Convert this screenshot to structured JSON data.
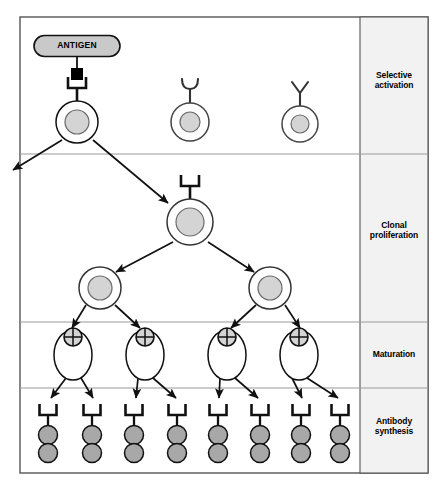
{
  "figure": {
    "frame": {
      "x": 20,
      "y": 17,
      "width": 408,
      "height": 456
    },
    "colors": {
      "outline": "#1a1a1a",
      "cell_fill": "#ffffff",
      "nucleus_fill": "#d4d4d4",
      "antibody_fill": "#a8a8a8",
      "antigen_fill": "#c9c9c9",
      "epitope_fill": "#000000",
      "panel_bg": "#f2f2f2",
      "divider": "#9a9a9a",
      "background": "#ffffff"
    }
  },
  "antigen": {
    "label": "ANTIGEN",
    "x": 77,
    "y": 46,
    "pill_width": 86,
    "pill_height": 21,
    "epitope": {
      "x": 77,
      "y": 74,
      "size": 11,
      "shape": "square"
    }
  },
  "stages": [
    {
      "id": "selective-activation",
      "label_line1": "Selective",
      "label_line2": "activation",
      "y_top": 17,
      "y_bottom": 154,
      "label_center_y": 82
    },
    {
      "id": "clonal-proliferation",
      "label_line1": "Clonal",
      "label_line2": "proliferation",
      "y_top": 154,
      "y_bottom": 322,
      "label_center_y": 232
    },
    {
      "id": "maturation",
      "label_line1": "Maturation",
      "label_line2": "",
      "y_top": 322,
      "y_bottom": 388,
      "label_center_y": 354
    },
    {
      "id": "antibody-synthesis",
      "label_line1": "Antibody",
      "label_line2": "synthesis",
      "y_top": 388,
      "y_bottom": 473,
      "label_center_y": 428
    }
  ],
  "panel": {
    "x": 360,
    "width": 68
  },
  "lymphocytes": [
    {
      "id": "lymphocyte-matching",
      "x": 77,
      "y": 122,
      "r_outer": 21,
      "r_inner": 12,
      "receptor": "bracket",
      "matched": true
    },
    {
      "id": "lymphocyte-u",
      "x": 190,
      "y": 122,
      "r_outer": 19,
      "r_inner": 10,
      "receptor": "u-shape",
      "matched": false
    },
    {
      "id": "lymphocyte-y",
      "x": 300,
      "y": 124,
      "r_outer": 18,
      "r_inner": 9,
      "receptor": "y-shape",
      "matched": false
    }
  ],
  "clonal_cells": [
    {
      "id": "clone-parent",
      "x": 190,
      "y": 222,
      "r_outer": 23,
      "r_inner": 14,
      "receptor": "bracket"
    },
    {
      "id": "clone-left",
      "x": 100,
      "y": 288,
      "r_outer": 21,
      "r_inner": 12,
      "receptor": "none"
    },
    {
      "id": "clone-right",
      "x": 270,
      "y": 288,
      "r_outer": 21,
      "r_inner": 12,
      "receptor": "none"
    }
  ],
  "plasma_cells": [
    {
      "id": "plasma-cell-1",
      "x": 73,
      "y": 355,
      "rx": 19,
      "ry": 25,
      "nucleus_x": 73,
      "nucleus_y": 337,
      "nucleus_r": 9
    },
    {
      "id": "plasma-cell-2",
      "x": 145,
      "y": 355,
      "rx": 19,
      "ry": 25,
      "nucleus_x": 145,
      "nucleus_y": 337,
      "nucleus_r": 9
    },
    {
      "id": "plasma-cell-3",
      "x": 227,
      "y": 355,
      "rx": 19,
      "ry": 25,
      "nucleus_x": 227,
      "nucleus_y": 337,
      "nucleus_r": 9
    },
    {
      "id": "plasma-cell-4",
      "x": 299,
      "y": 355,
      "rx": 19,
      "ry": 25,
      "nucleus_x": 299,
      "nucleus_y": 337,
      "nucleus_r": 9
    }
  ],
  "antibodies": [
    {
      "id": "antibody-1",
      "x": 48
    },
    {
      "id": "antibody-2",
      "x": 92
    },
    {
      "id": "antibody-3",
      "x": 134
    },
    {
      "id": "antibody-4",
      "x": 177
    },
    {
      "id": "antibody-5",
      "x": 218
    },
    {
      "id": "antibody-6",
      "x": 260
    },
    {
      "id": "antibody-7",
      "x": 301
    },
    {
      "id": "antibody-8",
      "x": 340
    }
  ],
  "antibody_geometry": {
    "receptor_y": 404,
    "circle1_y": 435,
    "circle2_y": 453,
    "circle_r": 9.5
  },
  "arrows": [
    {
      "id": "arrow-memory-exit",
      "x1": 62,
      "y1": 140,
      "x2": 13,
      "y2": 170
    },
    {
      "id": "arrow-activation-to-clone",
      "x1": 93,
      "y1": 140,
      "x2": 168,
      "y2": 203
    },
    {
      "id": "arrow-clone-to-left",
      "x1": 173,
      "y1": 242,
      "x2": 116,
      "y2": 272
    },
    {
      "id": "arrow-clone-to-right",
      "x1": 208,
      "y1": 242,
      "x2": 254,
      "y2": 272
    },
    {
      "id": "arrow-left-to-plasma1",
      "x1": 86,
      "y1": 305,
      "x2": 72,
      "y2": 328
    },
    {
      "id": "arrow-left-to-plasma2",
      "x1": 115,
      "y1": 305,
      "x2": 140,
      "y2": 328
    },
    {
      "id": "arrow-right-to-plasma3",
      "x1": 256,
      "y1": 305,
      "x2": 231,
      "y2": 328
    },
    {
      "id": "arrow-right-to-plasma4",
      "x1": 285,
      "y1": 305,
      "x2": 300,
      "y2": 328
    },
    {
      "id": "arrow-plasma1-ab1",
      "x1": 66,
      "y1": 378,
      "x2": 51,
      "y2": 398
    },
    {
      "id": "arrow-plasma1-ab2",
      "x1": 81,
      "y1": 378,
      "x2": 93,
      "y2": 398
    },
    {
      "id": "arrow-plasma2-ab3",
      "x1": 138,
      "y1": 378,
      "x2": 136,
      "y2": 398
    },
    {
      "id": "arrow-plasma2-ab4",
      "x1": 153,
      "y1": 378,
      "x2": 176,
      "y2": 398
    },
    {
      "id": "arrow-plasma3-ab5",
      "x1": 220,
      "y1": 378,
      "x2": 219,
      "y2": 398
    },
    {
      "id": "arrow-plasma3-ab6",
      "x1": 235,
      "y1": 378,
      "x2": 258,
      "y2": 398
    },
    {
      "id": "arrow-plasma4-ab7",
      "x1": 292,
      "y1": 378,
      "x2": 302,
      "y2": 398
    },
    {
      "id": "arrow-plasma4-ab8",
      "x1": 307,
      "y1": 378,
      "x2": 338,
      "y2": 398
    }
  ]
}
